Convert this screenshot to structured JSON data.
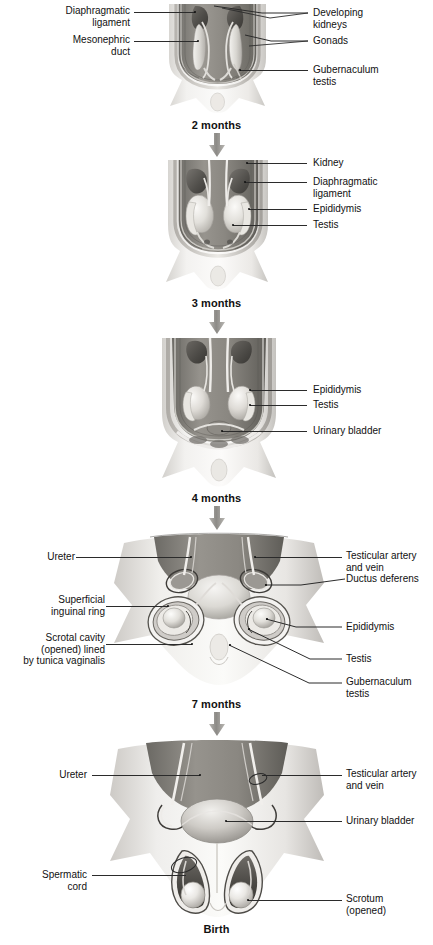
{
  "figure": {
    "type": "anatomical-illustration-series",
    "panel_count": 5,
    "background_color": "#ffffff",
    "line_color": "#2b2b2b",
    "text_color": "#111111"
  },
  "stages": [
    {
      "caption": "2 months",
      "labels_left": [
        {
          "text": "Diaphragmatic\nligament"
        },
        {
          "text": "Mesonephric\nduct"
        }
      ],
      "labels_right": [
        {
          "text": "Developing\nkidneys"
        },
        {
          "text": "Gonads"
        },
        {
          "text": "Gubernaculum\ntestis"
        }
      ]
    },
    {
      "caption": "3 months",
      "labels_left": [],
      "labels_right": [
        {
          "text": "Kidney"
        },
        {
          "text": "Diaphragmatic\nligament"
        },
        {
          "text": "Epididymis"
        },
        {
          "text": "Testis"
        }
      ]
    },
    {
      "caption": "4 months",
      "labels_left": [],
      "labels_right": [
        {
          "text": "Epididymis"
        },
        {
          "text": "Testis"
        },
        {
          "text": "Urinary bladder"
        }
      ]
    },
    {
      "caption": "7 months",
      "labels_left": [
        {
          "text": "Ureter"
        },
        {
          "text": "Superficial\ninguinal ring"
        },
        {
          "text": "Scrotal cavity\n(opened) lined\nby tunica vaginalis"
        }
      ],
      "labels_right": [
        {
          "text": "Testicular artery\nand vein"
        },
        {
          "text": "Ductus deferens"
        },
        {
          "text": "Epididymis"
        },
        {
          "text": "Testis"
        },
        {
          "text": "Gubernaculum\ntestis"
        }
      ]
    },
    {
      "caption": "Birth",
      "labels_left": [
        {
          "text": "Ureter"
        },
        {
          "text": "Spermatic\ncord"
        }
      ],
      "labels_right": [
        {
          "text": "Testicular artery\nand vein"
        },
        {
          "text": "Urinary bladder"
        },
        {
          "text": "Scrotum\n(opened)"
        }
      ]
    }
  ]
}
